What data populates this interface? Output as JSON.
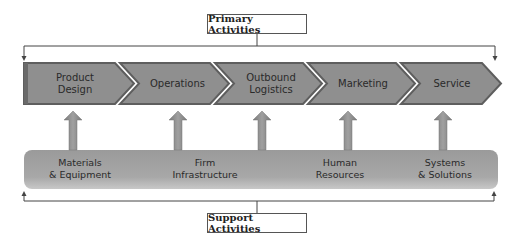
{
  "title_top": "Primary Activities",
  "title_bottom": "Support Activities",
  "primary_activities": [
    {
      "label": "Product\nDesign"
    },
    {
      "label": "Operations"
    },
    {
      "label": "Outbound\nLogistics"
    },
    {
      "label": "Marketing"
    },
    {
      "label": "Service"
    }
  ],
  "support_activities": [
    {
      "label": "Materials\n& Equipment"
    },
    {
      "label": "Firm\nInfrastructure"
    },
    {
      "label": "Human\nResources"
    },
    {
      "label": "Systems\n& Solutions"
    }
  ],
  "colors": {
    "chevron_fill": "#8f8f8f",
    "chevron_border": "#5e5e5e",
    "support_bar": "#a3a3a3",
    "arrow": "#8c8c8c",
    "lines": "#444444"
  }
}
